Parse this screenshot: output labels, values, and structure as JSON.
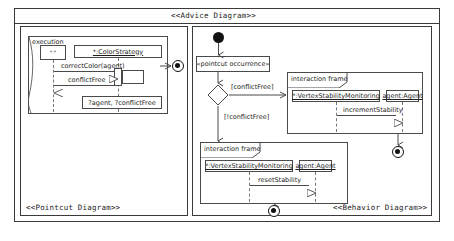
{
  "diagram": {
    "title": "<<Advice Diagram>>",
    "pointcut_panel_title": "<<Pointcut Diagram>>",
    "behavior_panel_title": "<<Behavior Diagram>>"
  },
  "pointcut": {
    "fragment_label": "execution",
    "anon_lifeline_label": "*:*",
    "target_lifeline_label": "*:ColorStrategy",
    "messages": [
      {
        "label": "correctColor(agent)",
        "direction": "right",
        "kind": "call"
      },
      {
        "label": "conflictFree",
        "direction": "left",
        "kind": "return"
      }
    ],
    "binding_note": "?agent, ?conflictFree",
    "final_node": "activity-final"
  },
  "behavior": {
    "initial_node": "initial-node",
    "action_label": "«pointcut occurrence»",
    "decision": {
      "name": "decision-node",
      "guard_true": "[conflictFree]",
      "guard_false": "[!conflictFree]"
    },
    "frames": [
      {
        "tag": "interaction frame",
        "lifelines": [
          "*:VertexStabilityMonitoring",
          "agent:Agent"
        ],
        "message": "incrementStability"
      },
      {
        "tag": "interaction frame",
        "lifelines": [
          "*:VertexStabilityMonitoring",
          "agent:Agent"
        ],
        "message": "resetStability"
      }
    ],
    "final_nodes": [
      "activity-final",
      "activity-final"
    ]
  },
  "colors": {
    "stroke": "#3a3a3a",
    "node_fill": "#111111",
    "background": "#ffffff",
    "lifeline_dash": "#777777"
  }
}
